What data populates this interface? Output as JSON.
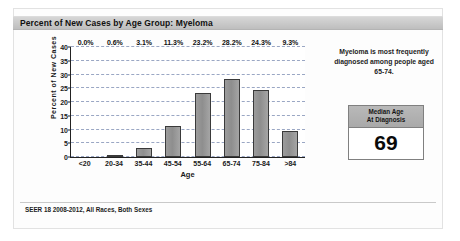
{
  "title": "Percent of New Cases by Age Group: Myeloma",
  "annotation": "Myeloma is most frequently diagnosed among people aged 65-74.",
  "median_box": {
    "header_line1": "Median Age",
    "header_line2": "At Diagnosis",
    "value": "69"
  },
  "footer": "SEER 18 2008-2012, All Races, Both Sexes",
  "colors": {
    "bar_fill": "#9c9c9c",
    "bar_border": "#3a3a3a",
    "gridline": "#9aa7c4",
    "title_bar": "#c9c9c9",
    "axis": "#222222"
  },
  "chart_data": {
    "type": "bar",
    "title": "Percent of New Cases by Age Group: Myeloma",
    "xlabel": "Age",
    "ylabel": "Percent of New Cases",
    "ylim": [
      0,
      40
    ],
    "yticks": [
      "0",
      "5",
      "10",
      "15",
      "20",
      "25",
      "30",
      "35",
      "40"
    ],
    "grid": true,
    "legend": "none",
    "categories": [
      "<20",
      "20-34",
      "35-44",
      "45-54",
      "55-64",
      "65-74",
      "75-84",
      ">84"
    ],
    "values": [
      0.0,
      0.6,
      3.1,
      11.3,
      23.2,
      28.2,
      24.3,
      9.3
    ],
    "data_labels": [
      "0.0%",
      "0.6%",
      "3.1%",
      "11.3%",
      "23.2%",
      "28.2%",
      "24.3%",
      "9.3%"
    ],
    "annotation": "Myeloma is most frequently diagnosed among people aged 65-74.",
    "source_note": "SEER 18 2008-2012, All Races, Both Sexes"
  }
}
